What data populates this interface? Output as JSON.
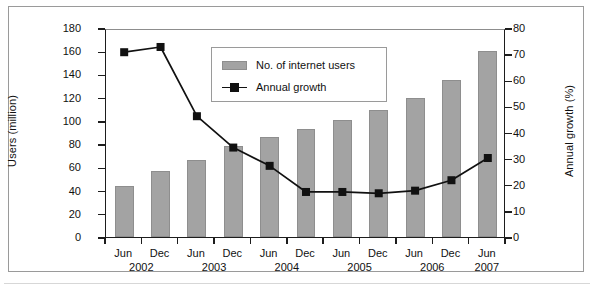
{
  "chart_data": {
    "type": "bar",
    "title": "",
    "subtitle": "",
    "categories": [
      "Jun 2002",
      "Dec 2002",
      "Jun 2003",
      "Dec 2003",
      "Jun 2004",
      "Dec 2004",
      "Jun 2005",
      "Dec 2005",
      "Jun 2006",
      "Dec 2006",
      "Jun 2007"
    ],
    "category_months": [
      "Jun",
      "Dec",
      "Jun",
      "Dec",
      "Jun",
      "Dec",
      "Jun",
      "Dec",
      "Jun",
      "Dec",
      "Jun"
    ],
    "category_year_groups": [
      {
        "year": "2002",
        "span": [
          0,
          1
        ]
      },
      {
        "year": "2003",
        "span": [
          2,
          3
        ]
      },
      {
        "year": "2004",
        "span": [
          4,
          5
        ]
      },
      {
        "year": "2005",
        "span": [
          6,
          7
        ]
      },
      {
        "year": "2006",
        "span": [
          8,
          9
        ]
      },
      {
        "year": "2007",
        "span": [
          10,
          10
        ]
      }
    ],
    "xlabel": "",
    "ylabel": "Users (million)",
    "y2label": "Annual growth (%)",
    "ylim": [
      0,
      180
    ],
    "y2lim": [
      0,
      80
    ],
    "yticks": [
      0,
      20,
      40,
      60,
      80,
      100,
      120,
      140,
      160,
      180
    ],
    "y2ticks": [
      0,
      10,
      20,
      30,
      40,
      50,
      60,
      70,
      80
    ],
    "grid": false,
    "legend_position": "inside-top-center",
    "series": [
      {
        "name": "No. of internet users",
        "type": "bar",
        "axis": "left",
        "unit": "million",
        "color": "#a3a3a3",
        "values": [
          44,
          57,
          66,
          78,
          86,
          93,
          101,
          109,
          120,
          135,
          160
        ]
      },
      {
        "name": "Annual growth",
        "type": "line",
        "axis": "right",
        "unit": "%",
        "color": "#111111",
        "marker": "square",
        "values": [
          71.5,
          73.5,
          47,
          35,
          28,
          18,
          18,
          17.5,
          18.5,
          22.5,
          31
        ]
      }
    ]
  },
  "legend": {
    "entries": [
      {
        "label": "No. of internet users",
        "swatch": "bar-swatch"
      },
      {
        "label": "Annual growth",
        "swatch": "line-marker-swatch"
      }
    ]
  },
  "axes": {
    "left_title": "Users (million)",
    "right_title": "Annual growth (%)",
    "left_ticks": [
      "0",
      "20",
      "40",
      "60",
      "80",
      "100",
      "120",
      "140",
      "160",
      "180"
    ],
    "right_ticks": [
      "0",
      "10",
      "20",
      "30",
      "40",
      "50",
      "60",
      "70",
      "80"
    ]
  },
  "colors": {
    "bar_fill": "#a3a3a3",
    "line": "#111111",
    "frame": "#9a9a9a",
    "axis": "#1d1d1d",
    "text": "#111111"
  }
}
